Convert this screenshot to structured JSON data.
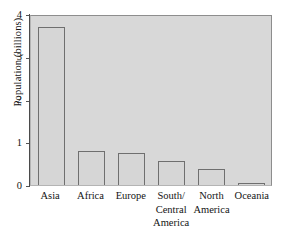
{
  "chart_data": {
    "type": "bar",
    "title": "",
    "xlabel": "",
    "ylabel": "Population (billions)",
    "categories": [
      "Asia",
      "Africa",
      "Europe",
      "South/ Central America",
      "North America",
      "Oceania"
    ],
    "category_lines": [
      [
        "Asia"
      ],
      [
        "Africa"
      ],
      [
        "Europe"
      ],
      [
        "South/",
        "Central",
        "America"
      ],
      [
        "North",
        "America"
      ],
      [
        "Oceania"
      ]
    ],
    "values": [
      3.7,
      0.8,
      0.76,
      0.56,
      0.37,
      0.03
    ],
    "ylim": [
      0,
      4
    ],
    "yticks": [
      0,
      1,
      2,
      3,
      4
    ],
    "ytick_labels": [
      "0",
      "1",
      "2",
      "3",
      "4"
    ],
    "grid": false,
    "legend": false,
    "colors": {
      "plot_background": "#d8d8d8",
      "bar_fill": "#d6d6d6",
      "bar_edge": "#6f6f6f",
      "frame": "#9a9a9a",
      "axis": "#4a4a4a",
      "text": "#141414"
    }
  }
}
